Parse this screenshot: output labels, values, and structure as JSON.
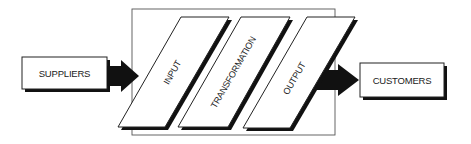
{
  "diagram": {
    "type": "process-flow",
    "colors": {
      "background": "#ffffff",
      "stroke": "#222222",
      "shadow": "#111111",
      "frame": "#555555"
    },
    "nodes": {
      "suppliers": {
        "label": "SUPPLIERS"
      },
      "input": {
        "label": "INPUT"
      },
      "transformation": {
        "label": "TRANSFORMATION"
      },
      "output": {
        "label": "OUTPUT"
      },
      "customers": {
        "label": "CUSTOMERS"
      }
    },
    "edges": [
      {
        "from": "SUPPLIERS",
        "to": "INPUT"
      },
      {
        "from": "OUTPUT",
        "to": "CUSTOMERS"
      }
    ]
  }
}
